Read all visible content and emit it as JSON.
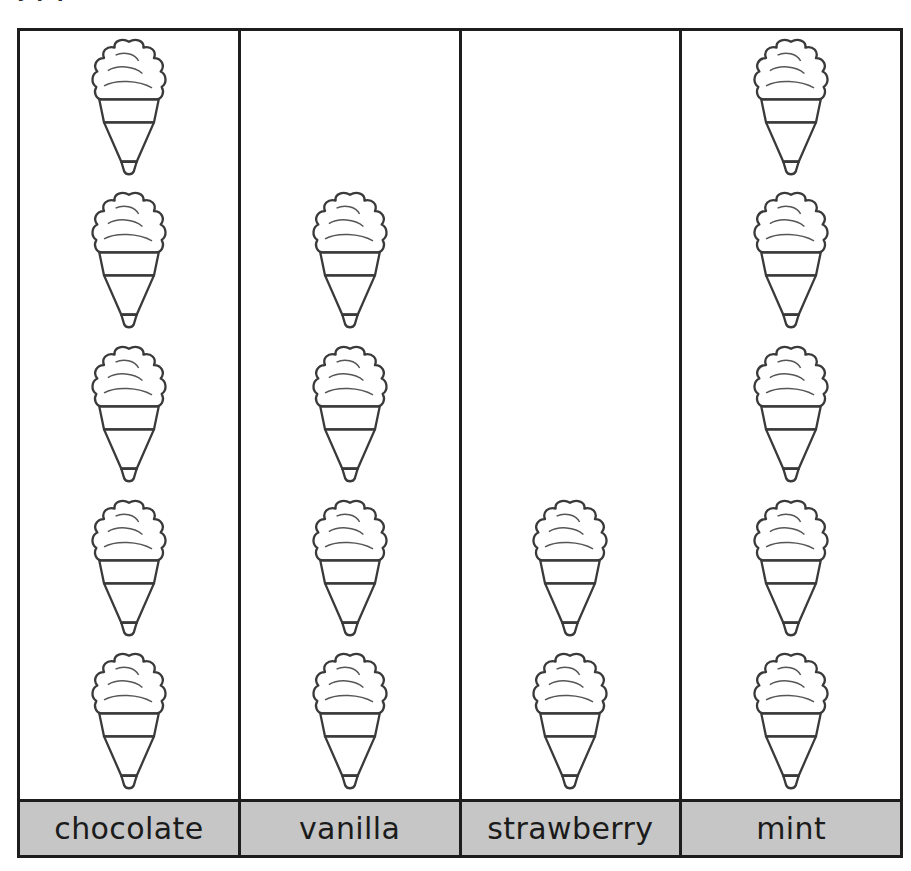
{
  "top_fragment": "y p  p",
  "chart_data": {
    "type": "bar",
    "subtype": "pictograph",
    "title": "",
    "xlabel": "",
    "ylabel": "",
    "categories": [
      "chocolate",
      "vanilla",
      "strawberry",
      "mint"
    ],
    "values": [
      5,
      4,
      2,
      5
    ],
    "ylim": [
      0,
      5
    ],
    "grid": false,
    "legend": null,
    "icon": "ice-cream-cone",
    "icon_unit_value": 1,
    "orientation": "vertical"
  },
  "columns": [
    {
      "key": "chocolate",
      "label": "chocolate",
      "count": 5,
      "scoop_color": "#8e8e8e",
      "scoop_shadow": "#6f6f6f"
    },
    {
      "key": "vanilla",
      "label": "vanilla",
      "count": 4,
      "scoop_color": "#fbfbfb",
      "scoop_shadow": "#ededed"
    },
    {
      "key": "strawberry",
      "label": "strawberry",
      "count": 2,
      "scoop_color": "#e7e7e7",
      "scoop_shadow": "#d6d6d6"
    },
    {
      "key": "mint",
      "label": "mint",
      "count": 5,
      "scoop_color": "#dcdcdc",
      "scoop_shadow": "#c9c9c9"
    }
  ],
  "rows_per_column": 5,
  "colors": {
    "frame": "#1d1d1d",
    "label_background": "#c6c6c6",
    "label_text": "#1b1b1b",
    "cone_band": "#cfcfcf",
    "cone_body": "#d3d3d3",
    "outline": "#3a3a3a",
    "page_background": "#ffffff"
  }
}
